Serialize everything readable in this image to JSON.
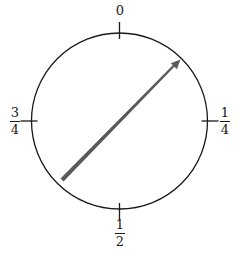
{
  "figure": {
    "name": "turn-circle-diagram",
    "background_color": "#ffffff",
    "circle": {
      "center_x": 119.5,
      "center_y": 121,
      "radius": 88,
      "stroke_color": "#1a1a1a",
      "stroke_width": 1.3,
      "fill": "none"
    },
    "ticks": [
      {
        "name": "tick-0",
        "angle_turns": 0,
        "inner_radius": 82,
        "outer_radius": 99
      },
      {
        "name": "tick-1-4",
        "angle_turns": 0.25,
        "inner_radius": 82,
        "outer_radius": 99
      },
      {
        "name": "tick-1-2",
        "angle_turns": 0.5,
        "inner_radius": 82,
        "outer_radius": 99
      },
      {
        "name": "tick-3-4",
        "angle_turns": 0.75,
        "inner_radius": 82,
        "outer_radius": 99
      }
    ],
    "tick_color": "#1a1a1a",
    "tick_width": 1.3,
    "labels": {
      "top": {
        "text": "0",
        "position": "top",
        "value_turns": 0
      },
      "right": {
        "numerator": "1",
        "denominator": "4",
        "position": "right",
        "value_turns": 0.25
      },
      "bottom": {
        "numerator": "1",
        "denominator": "2",
        "position": "bottom",
        "value_turns": 0.5
      },
      "left": {
        "numerator": "3",
        "denominator": "4",
        "position": "left",
        "value_turns": 0.75
      }
    },
    "arrow": {
      "name": "direction-arrow",
      "tail_x": 62,
      "tail_y": 180,
      "tip_x": 179,
      "tip_y": 61,
      "color": "#595959",
      "tail_width": 4.2,
      "tip_width": 1.0,
      "head_size": 6,
      "points_toward_turns": 0.125
    }
  }
}
